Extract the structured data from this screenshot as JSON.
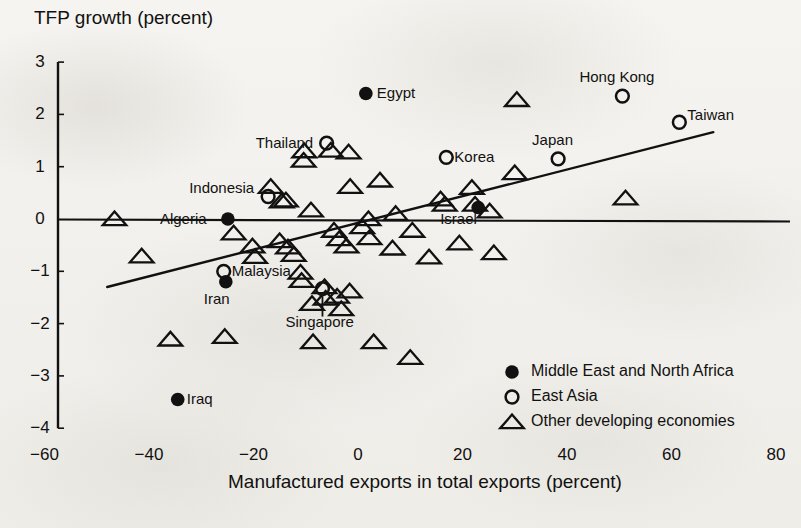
{
  "chart_data": {
    "type": "scatter",
    "title": "",
    "ylabel": "TFP growth (percent)",
    "xlabel": "Manufactured exports in total exports (percent)",
    "xlim": [
      -70,
      80
    ],
    "ylim": [
      -4,
      3
    ],
    "xticks": [
      -60,
      -40,
      -20,
      0,
      20,
      40,
      60,
      80
    ],
    "yticks": [
      3,
      2,
      1,
      0,
      -1,
      -2,
      -3,
      -4
    ],
    "xtick_labels": [
      "-60",
      "-40",
      "-20",
      "0",
      "20",
      "40",
      "60",
      "80"
    ],
    "ytick_labels": [
      "3",
      "2",
      "1",
      "0",
      "-1",
      "-2",
      "-3",
      "-4"
    ],
    "grid": false,
    "legend_position": "bottom-right",
    "legend": [
      {
        "marker": "filled-circle",
        "label": "Middle East and North Africa"
      },
      {
        "marker": "open-circle",
        "label": "East Asia"
      },
      {
        "marker": "open-triangle",
        "label": "Other developing economies"
      }
    ],
    "reference_line": {
      "y": 0,
      "x_from": -70,
      "x_to": 80
    },
    "trend_line": {
      "x_from": -48,
      "y_from": -1.3,
      "x_to": 68,
      "y_to": 1.66
    },
    "series": [
      {
        "name": "Middle East and North Africa",
        "marker": "filled-circle",
        "points": [
          {
            "label": "Egypt",
            "x": 1.5,
            "y": 2.4,
            "label_pos": "right"
          },
          {
            "label": "Algeria",
            "x": -24.9,
            "y": 0.0,
            "label_pos": "left"
          },
          {
            "label": "Israel",
            "x": 23.0,
            "y": 0.22,
            "label_pos": "below-left"
          },
          {
            "label": "Iran",
            "x": -25.3,
            "y": -1.2,
            "label_pos": "below"
          },
          {
            "label": "Iraq",
            "x": -34.5,
            "y": -3.45,
            "label_pos": "right"
          }
        ]
      },
      {
        "name": "East Asia",
        "marker": "open-circle",
        "points": [
          {
            "label": "Hong Kong",
            "x": 50.6,
            "y": 2.35,
            "label_pos": "above"
          },
          {
            "label": "Taiwan",
            "x": 61.5,
            "y": 1.85,
            "label_pos": "right"
          },
          {
            "label": "Thailand",
            "x": -6.0,
            "y": 1.45,
            "label_pos": "left"
          },
          {
            "label": "Korea",
            "x": 16.9,
            "y": 1.18,
            "label_pos": "right"
          },
          {
            "label": "Japan",
            "x": 38.3,
            "y": 1.15,
            "label_pos": "above"
          },
          {
            "label": "Indonesia",
            "x": -17.2,
            "y": 0.43,
            "label_pos": "left"
          },
          {
            "label": "Malaysia",
            "x": -25.7,
            "y": -1.0,
            "label_pos": "right"
          },
          {
            "label": "Singapore",
            "x": -6.8,
            "y": -1.33,
            "label_pos": "below-leader"
          }
        ]
      },
      {
        "name": "Other developing economies",
        "marker": "open-triangle",
        "points": [
          {
            "x": -46.6,
            "y": 0.0
          },
          {
            "x": -41.4,
            "y": -0.71
          },
          {
            "x": -35.9,
            "y": -2.3
          },
          {
            "x": -25.5,
            "y": -2.25
          },
          {
            "x": -23.8,
            "y": -0.27
          },
          {
            "x": -20.2,
            "y": -0.52
          },
          {
            "x": -19.7,
            "y": -0.72
          },
          {
            "x": -16.7,
            "y": 0.62
          },
          {
            "x": -14.6,
            "y": 0.34
          },
          {
            "x": -13.8,
            "y": 0.36
          },
          {
            "x": -15.0,
            "y": -0.42
          },
          {
            "x": -13.4,
            "y": -0.54
          },
          {
            "x": -12.3,
            "y": -0.68
          },
          {
            "x": -11.0,
            "y": -1.02
          },
          {
            "x": -10.8,
            "y": -1.18
          },
          {
            "x": -10.3,
            "y": 1.3
          },
          {
            "x": -10.4,
            "y": 1.12
          },
          {
            "x": -9.0,
            "y": 0.17
          },
          {
            "x": -5.2,
            "y": 1.31
          },
          {
            "x": -1.8,
            "y": 1.28
          },
          {
            "x": -4.6,
            "y": -0.22
          },
          {
            "x": -3.6,
            "y": -0.38
          },
          {
            "x": -2.2,
            "y": -0.52
          },
          {
            "x": -6.4,
            "y": -1.3
          },
          {
            "x": -6.2,
            "y": -1.52
          },
          {
            "x": -4.0,
            "y": -1.48
          },
          {
            "x": -1.6,
            "y": -1.38
          },
          {
            "x": -8.8,
            "y": -1.62
          },
          {
            "x": -3.2,
            "y": -1.72
          },
          {
            "x": -8.6,
            "y": -2.35
          },
          {
            "x": -1.5,
            "y": 0.62
          },
          {
            "x": 0.8,
            "y": -0.15
          },
          {
            "x": 2.2,
            "y": -0.36
          },
          {
            "x": 2.0,
            "y": 0.0
          },
          {
            "x": 4.2,
            "y": 0.74
          },
          {
            "x": 3.0,
            "y": -2.35
          },
          {
            "x": 6.6,
            "y": -0.56
          },
          {
            "x": 7.2,
            "y": 0.1
          },
          {
            "x": 10.4,
            "y": -0.22
          },
          {
            "x": 10.0,
            "y": -2.65
          },
          {
            "x": 13.6,
            "y": -0.73
          },
          {
            "x": 15.8,
            "y": 0.38
          },
          {
            "x": 16.6,
            "y": 0.28
          },
          {
            "x": 19.4,
            "y": -0.46
          },
          {
            "x": 21.8,
            "y": 0.6
          },
          {
            "x": 22.4,
            "y": 0.28
          },
          {
            "x": 25.2,
            "y": 0.15
          },
          {
            "x": 26.0,
            "y": -0.65
          },
          {
            "x": 30.0,
            "y": 0.88
          },
          {
            "x": 30.4,
            "y": 2.28
          },
          {
            "x": 51.2,
            "y": 0.4
          }
        ]
      }
    ]
  }
}
